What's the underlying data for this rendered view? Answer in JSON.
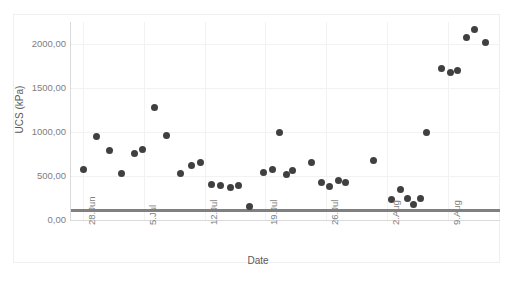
{
  "chart_data": {
    "type": "scatter",
    "title": "",
    "xlabel": "Date",
    "ylabel": "UCS (kPa)",
    "ylim": [
      0,
      2250
    ],
    "yticks": [
      0,
      500,
      1000,
      1500,
      2000
    ],
    "ytick_labels": [
      "0,00",
      "500,00",
      "1000,00",
      "1500,00",
      "2000,00"
    ],
    "xtick_labels": [
      "28.Jun",
      "5.Jul",
      "12.Jul",
      "19.Jul",
      "26.Jul",
      "2.Aug",
      "9.Aug"
    ],
    "xtick_days": [
      0,
      7,
      14,
      21,
      28,
      35,
      42
    ],
    "xlim": [
      -1.5,
      48
    ],
    "grid": true,
    "legend": null,
    "marker_color": "#404040",
    "threshold_color": "#808080",
    "grid_color": "#f2f2f2",
    "axis_color": "#d9d9d9",
    "threshold": {
      "label": "",
      "value": 120,
      "x_start": -1.5,
      "x_end": 48
    },
    "series": [
      {
        "name": "UCS (kPa)",
        "points": [
          {
            "x": 0.0,
            "y": 570
          },
          {
            "x": 1.6,
            "y": 950
          },
          {
            "x": 3.1,
            "y": 790
          },
          {
            "x": 4.4,
            "y": 530
          },
          {
            "x": 5.9,
            "y": 760
          },
          {
            "x": 6.9,
            "y": 800
          },
          {
            "x": 8.2,
            "y": 1275
          },
          {
            "x": 9.6,
            "y": 960
          },
          {
            "x": 11.2,
            "y": 530
          },
          {
            "x": 12.5,
            "y": 620
          },
          {
            "x": 13.5,
            "y": 650
          },
          {
            "x": 14.8,
            "y": 400
          },
          {
            "x": 15.8,
            "y": 390
          },
          {
            "x": 17.0,
            "y": 370
          },
          {
            "x": 17.9,
            "y": 390
          },
          {
            "x": 19.2,
            "y": 150
          },
          {
            "x": 20.8,
            "y": 540
          },
          {
            "x": 21.8,
            "y": 570
          },
          {
            "x": 22.6,
            "y": 990
          },
          {
            "x": 23.4,
            "y": 520
          },
          {
            "x": 24.1,
            "y": 560
          },
          {
            "x": 26.3,
            "y": 650
          },
          {
            "x": 27.5,
            "y": 430
          },
          {
            "x": 28.4,
            "y": 380
          },
          {
            "x": 29.4,
            "y": 450
          },
          {
            "x": 30.2,
            "y": 430
          },
          {
            "x": 33.4,
            "y": 680
          },
          {
            "x": 35.5,
            "y": 230
          },
          {
            "x": 36.5,
            "y": 350
          },
          {
            "x": 37.4,
            "y": 245
          },
          {
            "x": 38.0,
            "y": 175
          },
          {
            "x": 38.8,
            "y": 240
          },
          {
            "x": 39.5,
            "y": 1000
          },
          {
            "x": 41.3,
            "y": 1720
          },
          {
            "x": 42.3,
            "y": 1680
          },
          {
            "x": 43.1,
            "y": 1700
          },
          {
            "x": 44.2,
            "y": 2070
          },
          {
            "x": 45.1,
            "y": 2160
          },
          {
            "x": 46.3,
            "y": 2020
          }
        ]
      }
    ]
  }
}
